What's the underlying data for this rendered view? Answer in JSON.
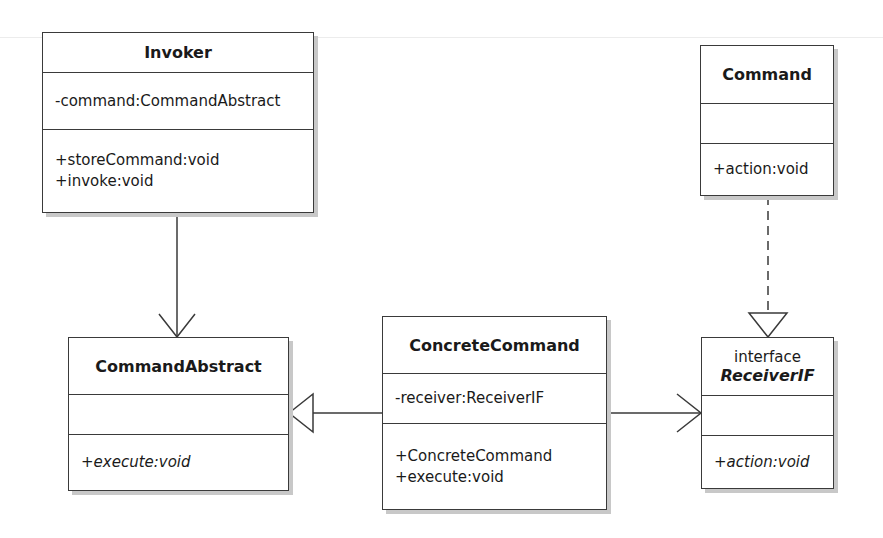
{
  "diagram": {
    "type": "UML class diagram",
    "classes": {
      "invoker": {
        "name": "Invoker",
        "attributes": [
          "-command:CommandAbstract"
        ],
        "operations": [
          "+storeCommand:void",
          "+invoke:void"
        ]
      },
      "command": {
        "name": "Command",
        "attributes": [],
        "operations": [
          "+action:void"
        ]
      },
      "command_abstract": {
        "name": "CommandAbstract",
        "attributes": [],
        "operations": [
          "+execute:void"
        ]
      },
      "concrete_command": {
        "name": "ConcreteCommand",
        "attributes": [
          "-receiver:ReceiverIF"
        ],
        "operations": [
          "+ConcreteCommand",
          "+execute:void"
        ]
      },
      "receiver_if": {
        "stereotype": "interface",
        "name": "ReceiverIF",
        "attributes": [],
        "operations": [
          "+action:void"
        ]
      }
    },
    "relationships": [
      {
        "from": "Invoker",
        "to": "CommandAbstract",
        "kind": "association",
        "style": "solid-open-arrow"
      },
      {
        "from": "ConcreteCommand",
        "to": "CommandAbstract",
        "kind": "generalization",
        "style": "solid-hollow-triangle"
      },
      {
        "from": "ConcreteCommand",
        "to": "ReceiverIF",
        "kind": "association",
        "style": "solid-open-arrow"
      },
      {
        "from": "Command",
        "to": "ReceiverIF",
        "kind": "realization",
        "style": "dashed-hollow-triangle"
      }
    ],
    "colors": {
      "line": "#3a3a3a",
      "shadow": "#c8c8c8",
      "background": "#ffffff"
    }
  }
}
